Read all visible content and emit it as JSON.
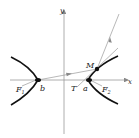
{
  "diagram": {
    "type": "hyperbola-reflection",
    "axes": {
      "x_label": "x",
      "y_label": "y"
    },
    "points": {
      "F1": {
        "label": "F",
        "sub": "1"
      },
      "F2": {
        "label": "F",
        "sub": "2"
      },
      "M": {
        "label": "M"
      },
      "T": {
        "label": "T"
      },
      "a": {
        "label": "a"
      },
      "b": {
        "label": "b"
      }
    },
    "colors": {
      "curve": "#111111",
      "axis": "#888888",
      "line": "#888888"
    }
  }
}
